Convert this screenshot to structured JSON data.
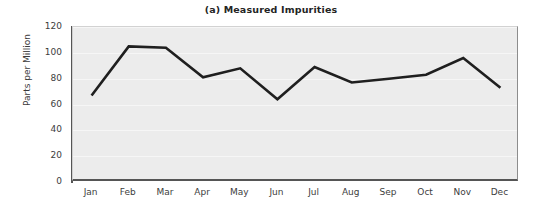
{
  "chart_data": {
    "type": "line",
    "title": "(a) Measured Impurities",
    "xlabel": "",
    "ylabel": "Parts per Million",
    "categories": [
      "Jan",
      "Feb",
      "Mar",
      "Apr",
      "May",
      "Jun",
      "Jul",
      "Aug",
      "Sep",
      "Oct",
      "Nov",
      "Dec"
    ],
    "values": [
      67,
      105,
      104,
      81,
      88,
      64,
      89,
      77,
      80,
      83,
      96,
      73
    ],
    "series": [
      {
        "name": "Measured Impurities",
        "values": [
          67,
          105,
          104,
          81,
          88,
          64,
          89,
          77,
          80,
          83,
          96,
          73
        ]
      }
    ],
    "ylim": [
      0,
      120
    ],
    "yticks": [
      0,
      20,
      40,
      60,
      80,
      100,
      120
    ],
    "ytick_labels": [
      "0",
      "20",
      "40",
      "60",
      "80",
      "100",
      "120"
    ],
    "grid": true,
    "grid_axis": "y",
    "legend": false,
    "legend_position": "none",
    "line_color": "#1f1f1f",
    "line_width": 2.6,
    "markers": false,
    "plot_background": "#ececec",
    "figure_background": "#ffffff",
    "axis_color": "#555555",
    "text_color": "#3d3d3d",
    "title_color": "#242424"
  }
}
